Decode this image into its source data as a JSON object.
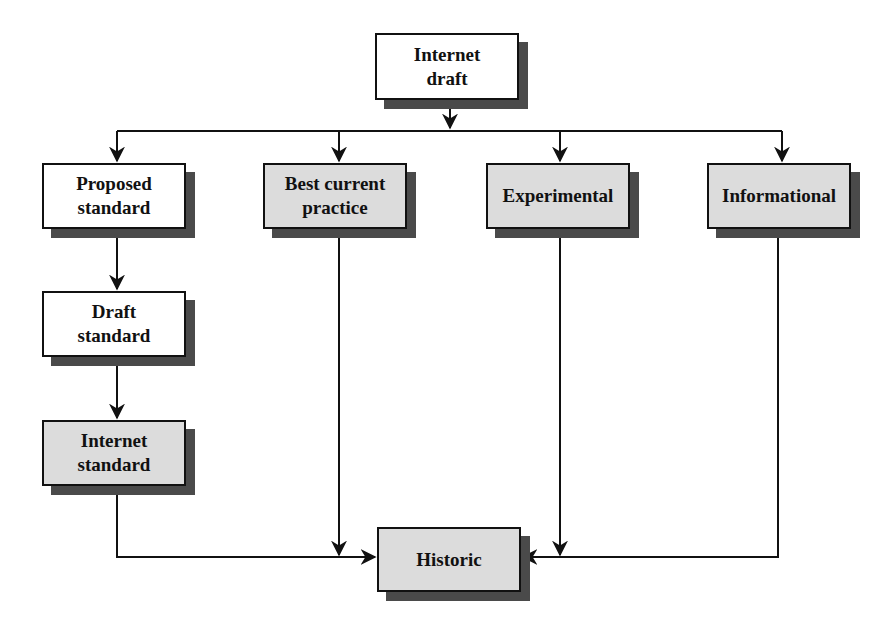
{
  "diagram": {
    "title": "",
    "nodes": [
      {
        "id": "internet-draft",
        "label": "Internet draft",
        "lines": [
          "Internet",
          "draft"
        ],
        "fill": "white"
      },
      {
        "id": "proposed-standard",
        "label": "Proposed standard",
        "lines": [
          "Proposed",
          "standard"
        ],
        "fill": "white"
      },
      {
        "id": "best-current-practice",
        "label": "Best current practice",
        "lines": [
          "Best current",
          "practice"
        ],
        "fill": "gray"
      },
      {
        "id": "experimental",
        "label": "Experimental",
        "lines": [
          "Experimental"
        ],
        "fill": "gray"
      },
      {
        "id": "informational",
        "label": "Informational",
        "lines": [
          "Informational"
        ],
        "fill": "gray"
      },
      {
        "id": "draft-standard",
        "label": "Draft standard",
        "lines": [
          "Draft",
          "standard"
        ],
        "fill": "white"
      },
      {
        "id": "internet-standard",
        "label": "Internet standard",
        "lines": [
          "Internet",
          "standard"
        ],
        "fill": "gray"
      },
      {
        "id": "historic",
        "label": "Historic",
        "lines": [
          "Historic"
        ],
        "fill": "gray"
      }
    ],
    "edges": [
      {
        "from": "internet-draft",
        "to": "proposed-standard"
      },
      {
        "from": "internet-draft",
        "to": "best-current-practice"
      },
      {
        "from": "internet-draft",
        "to": "experimental"
      },
      {
        "from": "internet-draft",
        "to": "informational"
      },
      {
        "from": "proposed-standard",
        "to": "draft-standard"
      },
      {
        "from": "draft-standard",
        "to": "internet-standard"
      },
      {
        "from": "internet-standard",
        "to": "historic"
      },
      {
        "from": "best-current-practice",
        "to": "historic"
      },
      {
        "from": "experimental",
        "to": "historic"
      },
      {
        "from": "informational",
        "to": "historic"
      }
    ],
    "colors": {
      "white_fill": "#ffffff",
      "gray_fill": "#dcdcdc",
      "shadow": "#4a4a4a",
      "line": "#111111"
    }
  }
}
